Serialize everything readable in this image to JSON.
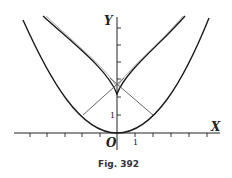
{
  "figure": {
    "caption": "Fig. 392",
    "axes": {
      "x_label": "X",
      "y_label": "Y",
      "origin_label": "O",
      "x_tick_label": "1",
      "y_tick_label": "1"
    },
    "curves": [
      {
        "name": "parabola",
        "description": "y = x^2/2 (parabola through origin)"
      },
      {
        "name": "evolute",
        "description": "semicubical parabola, evolute of the parabola, cusp on Y-axis at y=1"
      },
      {
        "name": "normals",
        "description": "two normals to the parabola meeting on the Y-axis"
      }
    ],
    "colors": {
      "curve": "#1a1a1a",
      "axis": "#222222",
      "normal": "#555555",
      "background": "#ffffff"
    }
  }
}
